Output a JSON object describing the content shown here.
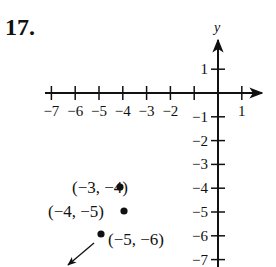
{
  "problem_number": "17.",
  "axes": {
    "x_label": "",
    "y_label": "y",
    "x_ticks": [
      {
        "value": -7,
        "label": "−7"
      },
      {
        "value": -6,
        "label": "−6"
      },
      {
        "value": -5,
        "label": "−5"
      },
      {
        "value": -4,
        "label": "−4"
      },
      {
        "value": -3,
        "label": "−3"
      },
      {
        "value": -2,
        "label": "−2"
      },
      {
        "value": -1,
        "label": ""
      },
      {
        "value": 1,
        "label": "1"
      }
    ],
    "y_ticks": [
      {
        "value": 1,
        "label": "1"
      },
      {
        "value": -1,
        "label": "−1"
      },
      {
        "value": -2,
        "label": "−2"
      },
      {
        "value": -3,
        "label": "−3"
      },
      {
        "value": -4,
        "label": "−4"
      },
      {
        "value": -5,
        "label": "−5"
      },
      {
        "value": -6,
        "label": "−6"
      },
      {
        "value": -7,
        "label": "−7"
      }
    ]
  },
  "points": [
    {
      "label": "(−3, −4)",
      "x": -3,
      "y": -4
    },
    {
      "label": "(−4, −5)",
      "x": -4,
      "y": -5
    },
    {
      "label": "(−5, −6)",
      "x": -5,
      "y": -6
    }
  ],
  "trend_arrow": "continues down-left",
  "colors": {
    "ink": "#111111",
    "background": "#ffffff"
  }
}
